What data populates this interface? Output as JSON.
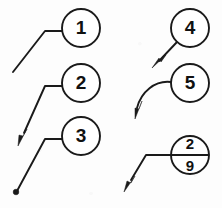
{
  "figure": {
    "background_color": "#fdfdfd",
    "line_color": "#1a1a1a",
    "width": 222,
    "height": 208
  },
  "callouts": [
    {
      "id": "callout-1",
      "label": "1",
      "terminator": "none",
      "leader_style": "straight-with-horizontal-landing",
      "circle": {
        "cx": 81,
        "cy": 28,
        "r": 19
      },
      "leader_path": "M 62 31 L 45 31 L 13 72",
      "label_x": 81,
      "label_y": 29
    },
    {
      "id": "callout-2",
      "label": "2",
      "terminator": "arrowhead",
      "leader_style": "straight-with-horizontal-landing",
      "circle": {
        "cx": 81,
        "cy": 83,
        "r": 19
      },
      "leader_path": "M 62 86 L 45 86 L 24 133",
      "arrow_tip": {
        "x": 18,
        "y": 146
      },
      "arrow_angle_deg": 114,
      "label_x": 81,
      "label_y": 84
    },
    {
      "id": "callout-3",
      "label": "3",
      "terminator": "dot",
      "leader_style": "straight-with-horizontal-landing",
      "circle": {
        "cx": 81,
        "cy": 136,
        "r": 19
      },
      "leader_path": "M 62 139 L 45 139 L 17 191",
      "dot": {
        "cx": 16,
        "cy": 192,
        "r": 2.8
      },
      "label_x": 81,
      "label_y": 137
    },
    {
      "id": "callout-4",
      "label": "4",
      "terminator": "arrowhead",
      "leader_style": "straight-direct",
      "circle": {
        "cx": 190,
        "cy": 28,
        "r": 19
      },
      "leader_path": "M 177 42 L 159 61",
      "arrow_tip": {
        "x": 152,
        "y": 68
      },
      "arrow_angle_deg": 135,
      "label_x": 190,
      "label_y": 29
    },
    {
      "id": "callout-5",
      "label": "5",
      "terminator": "arrowhead",
      "leader_style": "curved-spline",
      "circle": {
        "cx": 190,
        "cy": 83,
        "r": 19
      },
      "leader_path": "M 171 82 C 155 80 141 92 137 108",
      "arrow_tip": {
        "x": 135,
        "y": 119
      },
      "arrow_angle_deg": 101,
      "label_x": 190,
      "label_y": 84
    },
    {
      "id": "callout-6",
      "label_top": "2",
      "label_bottom": "9",
      "terminator": "arrowhead",
      "leader_style": "straight-with-horizontal-landing-split-balloon",
      "circle": {
        "cx": 190,
        "cy": 155,
        "r": 19
      },
      "divider": {
        "x1": 171,
        "y1": 155,
        "x2": 209,
        "y2": 155
      },
      "leader_path": "M 171 155 L 146 155 L 131 180",
      "arrow_tip": {
        "x": 124,
        "y": 192
      },
      "arrow_angle_deg": 121,
      "label_top_x": 190,
      "label_top_y": 145,
      "label_bottom_x": 190,
      "label_bottom_y": 167
    }
  ]
}
